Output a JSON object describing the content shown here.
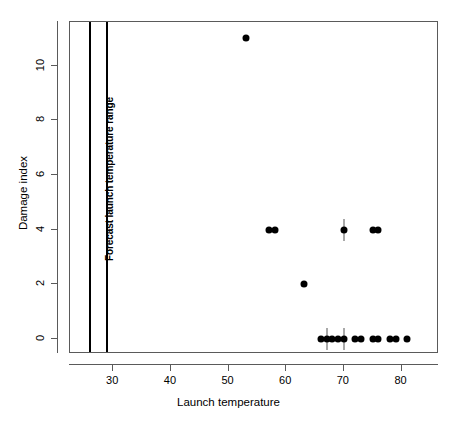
{
  "chart_data": {
    "type": "scatter",
    "title": "",
    "xlabel": "Launch temperature",
    "ylabel": "Damage index",
    "xlim": [
      22.5,
      86.5
    ],
    "ylim": [
      -0.55,
      11.6
    ],
    "grid": false,
    "legend": null,
    "xticks": [
      30,
      40,
      50,
      60,
      70,
      80
    ],
    "xticklabels": [
      "30",
      "40",
      "50",
      "60",
      "70",
      "80"
    ],
    "yticks": [
      0,
      2,
      4,
      6,
      8,
      10
    ],
    "yticklabels": [
      "0",
      "2",
      "4",
      "6",
      "8",
      "10"
    ],
    "points": [
      {
        "x": 53,
        "y": 11
      },
      {
        "x": 57,
        "y": 4
      },
      {
        "x": 58,
        "y": 4
      },
      {
        "x": 70,
        "y": 4
      },
      {
        "x": 75,
        "y": 4
      },
      {
        "x": 76,
        "y": 4
      },
      {
        "x": 63,
        "y": 2
      },
      {
        "x": 66,
        "y": 0
      },
      {
        "x": 67,
        "y": 0
      },
      {
        "x": 68,
        "y": 0
      },
      {
        "x": 69,
        "y": 0
      },
      {
        "x": 70,
        "y": 0
      },
      {
        "x": 72,
        "y": 0
      },
      {
        "x": 73,
        "y": 0
      },
      {
        "x": 75,
        "y": 0
      },
      {
        "x": 76,
        "y": 0
      },
      {
        "x": 78,
        "y": 0
      },
      {
        "x": 79,
        "y": 0
      },
      {
        "x": 81,
        "y": 0
      }
    ],
    "overplot_marks": [
      {
        "x": 70,
        "y": 4
      },
      {
        "x": 67,
        "y": 0
      },
      {
        "x": 70,
        "y": 0
      }
    ],
    "vertical_lines": [
      {
        "x": 26,
        "label": "forecast-range-lower"
      },
      {
        "x": 29,
        "label": "forecast-range-upper"
      }
    ],
    "annotation": {
      "text": "Forecast launch temperature range",
      "x": 27.5,
      "rotation": -90
    }
  },
  "colors": {
    "point": "#000000",
    "axis": "#5a5a5a",
    "panel_border": "#5a5a5a",
    "vline": "#000000",
    "background": "#ffffff"
  }
}
